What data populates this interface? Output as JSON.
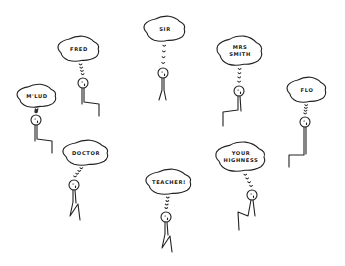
{
  "scene": {
    "description": "Hand-drawn stick figures, each thinking of a name/title in a thought bubble",
    "figures": [
      {
        "id": "mlud",
        "label": "M'LUD",
        "lines": [
          "M'LUD"
        ],
        "bubble": {
          "cx": 37,
          "cy": 96,
          "rx": 19,
          "ry": 11
        },
        "head": {
          "cx": 36,
          "cy": 120
        },
        "pose": "sitting-right"
      },
      {
        "id": "fred",
        "label": "FRED",
        "lines": [
          "FRED"
        ],
        "bubble": {
          "cx": 79,
          "cy": 49,
          "rx": 20,
          "ry": 12
        },
        "head": {
          "cx": 83,
          "cy": 83
        },
        "pose": "sitting-right"
      },
      {
        "id": "sir",
        "label": "SIR",
        "lines": [
          "SIR"
        ],
        "bubble": {
          "cx": 165,
          "cy": 29,
          "rx": 20,
          "ry": 12
        },
        "head": {
          "cx": 163,
          "cy": 73
        },
        "pose": "standing"
      },
      {
        "id": "mrs-smith",
        "label": "MRS SMITH",
        "lines": [
          "MRS",
          "SMITH"
        ],
        "bubble": {
          "cx": 240,
          "cy": 51,
          "rx": 22,
          "ry": 14
        },
        "head": {
          "cx": 239,
          "cy": 91
        },
        "pose": "sitting-left"
      },
      {
        "id": "flo",
        "label": "FLO",
        "lines": [
          "FLO"
        ],
        "bubble": {
          "cx": 307,
          "cy": 90,
          "rx": 19,
          "ry": 12
        },
        "head": {
          "cx": 305,
          "cy": 122
        },
        "pose": "sitting-left-tall"
      },
      {
        "id": "doctor",
        "label": "DOCTOR",
        "lines": [
          "DOCTOR"
        ],
        "bubble": {
          "cx": 86,
          "cy": 153,
          "rx": 22,
          "ry": 12
        },
        "head": {
          "cx": 74,
          "cy": 185
        },
        "pose": "sitting-zigzag"
      },
      {
        "id": "teacher",
        "label": "TEACHER!",
        "lines": [
          "TEACHER!"
        ],
        "bubble": {
          "cx": 169,
          "cy": 182,
          "rx": 22,
          "ry": 12
        },
        "head": {
          "cx": 166,
          "cy": 217
        },
        "pose": "sitting-zigzag"
      },
      {
        "id": "your-highness",
        "label": "YOUR HIGHNESS",
        "lines": [
          "YOUR",
          "HIGHNESS"
        ],
        "bubble": {
          "cx": 241,
          "cy": 157,
          "rx": 24,
          "ry": 14
        },
        "head": {
          "cx": 252,
          "cy": 195
        },
        "pose": "sitting-zigzag-left"
      }
    ]
  },
  "colors": {
    "ink": "#222222",
    "background": "#ffffff"
  }
}
